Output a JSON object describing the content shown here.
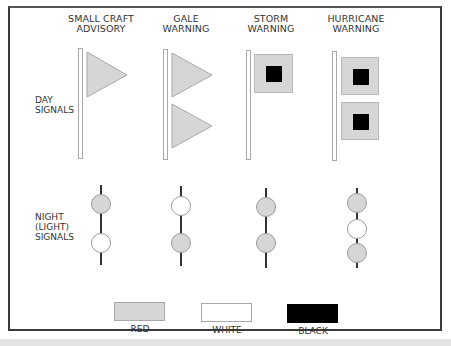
{
  "columns": [
    {
      "id": "small-craft",
      "title_line1": "SMALL CRAFT",
      "title_line2": "ADVISORY"
    },
    {
      "id": "gale",
      "title_line1": "GALE",
      "title_line2": "WARNING"
    },
    {
      "id": "storm",
      "title_line1": "STORM",
      "title_line2": "WARNING"
    },
    {
      "id": "hurricane",
      "title_line1": "HURRICANE",
      "title_line2": "WARNING"
    }
  ],
  "rows": {
    "day": {
      "line1": "DAY",
      "line2": "SIGNALS"
    },
    "night": {
      "line1": "NIGHT",
      "line2": "(LIGHT)",
      "line3": "SIGNALS"
    }
  },
  "day_signals": {
    "small-craft": [
      "red-triangular-pennant"
    ],
    "gale": [
      "red-triangular-pennant",
      "red-triangular-pennant"
    ],
    "storm": [
      "red-square-flag-black-center"
    ],
    "hurricane": [
      "red-square-flag-black-center",
      "red-square-flag-black-center"
    ]
  },
  "night_signals": {
    "small-craft": [
      "red",
      "white"
    ],
    "gale": [
      "white",
      "red"
    ],
    "storm": [
      "red",
      "red"
    ],
    "hurricane": [
      "red",
      "white",
      "red"
    ]
  },
  "legend": [
    {
      "label": "RED",
      "color": "#d6d6d6"
    },
    {
      "label": "WHITE",
      "color": "#ffffff"
    },
    {
      "label": "BLACK",
      "color": "#000000"
    }
  ],
  "colors": {
    "red_fill": "#d6d6d6",
    "white_fill": "#ffffff",
    "black_fill": "#000000",
    "frame": "#3a3a3a"
  }
}
